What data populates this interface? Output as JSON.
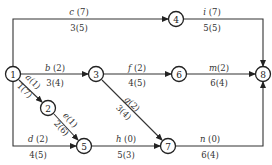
{
  "diagram": {
    "type": "activity-on-arrow network",
    "nodes": [
      {
        "id": "1",
        "label": "1",
        "x": 13,
        "y": 74
      },
      {
        "id": "2",
        "label": "2",
        "x": 48,
        "y": 108
      },
      {
        "id": "3",
        "label": "3",
        "x": 96,
        "y": 74
      },
      {
        "id": "4",
        "label": "4",
        "x": 176,
        "y": 19
      },
      {
        "id": "5",
        "label": "5",
        "x": 84,
        "y": 146
      },
      {
        "id": "6",
        "label": "6",
        "x": 179,
        "y": 74
      },
      {
        "id": "7",
        "label": "7",
        "x": 168,
        "y": 146
      },
      {
        "id": "8",
        "label": "8",
        "x": 263,
        "y": 74
      }
    ],
    "edges": [
      {
        "from": "1",
        "to": "4",
        "activity": "c",
        "duration": "(7)",
        "below": "3(5)"
      },
      {
        "from": "4",
        "to": "8",
        "activity": "i",
        "duration": "(7)",
        "below": "5(5)"
      },
      {
        "from": "1",
        "to": "3",
        "activity": "b",
        "duration": "(2)",
        "below": "3(4)"
      },
      {
        "from": "3",
        "to": "6",
        "activity": "f",
        "duration": "(2)",
        "below": "4(5)"
      },
      {
        "from": "6",
        "to": "8",
        "activity": "m",
        "duration": "(2)",
        "below": "6(4)"
      },
      {
        "from": "1",
        "to": "2",
        "activity": "a",
        "duration": "(1)",
        "below": "1(7)"
      },
      {
        "from": "2",
        "to": "5",
        "activity": "e",
        "duration": "(1)",
        "below": "2(6)"
      },
      {
        "from": "3",
        "to": "7",
        "activity": "g",
        "duration": "(2)",
        "below": "3(4)"
      },
      {
        "from": "1",
        "to": "5",
        "activity": "d",
        "duration": "(2)",
        "below": "4(5)"
      },
      {
        "from": "5",
        "to": "7",
        "activity": "h",
        "duration": "(0)",
        "below": "5(3)"
      },
      {
        "from": "7",
        "to": "8",
        "activity": "n",
        "duration": "(0)",
        "below": "6(4)"
      }
    ]
  }
}
